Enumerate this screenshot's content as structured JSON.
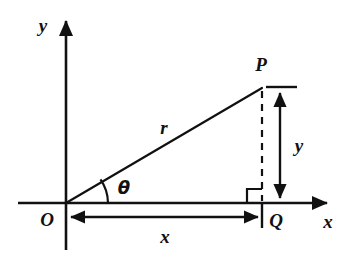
{
  "diagram": {
    "type": "right-triangle-polar-coordinates",
    "background_color": "#ffffff",
    "stroke_color": "#111111",
    "axes": {
      "x_axis_label": "x",
      "y_axis_label": "y",
      "origin_label": "O"
    },
    "points": {
      "origin": "O",
      "apex": "P",
      "foot": "Q"
    },
    "labels": {
      "hypotenuse": "r",
      "angle": "θ",
      "horizontal_leg": "x",
      "vertical_leg": "y",
      "point_p": "P",
      "point_q": "Q",
      "point_o": "O",
      "axis_x": "x",
      "axis_y": "y"
    },
    "geometry": {
      "origin_px": [
        66,
        203
      ],
      "apex_px": [
        262,
        88
      ],
      "foot_px": [
        262,
        203
      ],
      "x_axis_arrow_tip_px": [
        330,
        203
      ],
      "y_axis_arrow_tip_px": [
        66,
        18
      ],
      "x_dimension_y_px": 217,
      "y_dimension_x_px": 280,
      "right_angle_marker_size_px": 15,
      "angle_arc_radius_px": 42
    }
  }
}
